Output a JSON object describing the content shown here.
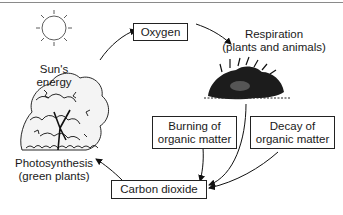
{
  "diagram": {
    "type": "carbon-oxygen cycle",
    "nodes": {
      "sun": {
        "line1": "Sun's",
        "line2": "energy",
        "icon": "sun-icon"
      },
      "oxygen": {
        "label": "Oxygen"
      },
      "respiration": {
        "line1": "Respiration",
        "line2": "(plants and animals)",
        "icon": "animal-icon"
      },
      "photosynthesis": {
        "line1": "Photosynthesis",
        "line2": "(green plants)",
        "icon": "tree-icon"
      },
      "burning": {
        "line1": "Burning of",
        "line2": "organic matter"
      },
      "decay": {
        "line1": "Decay of",
        "line2": "organic matter"
      },
      "carbon_dioxide": {
        "label": "Carbon dioxide"
      }
    },
    "edges": [
      {
        "from": "photosynthesis",
        "to": "oxygen"
      },
      {
        "from": "oxygen",
        "to": "respiration"
      },
      {
        "from": "respiration",
        "to": "carbon_dioxide"
      },
      {
        "from": "burning",
        "to": "carbon_dioxide"
      },
      {
        "from": "decay",
        "to": "carbon_dioxide"
      },
      {
        "from": "carbon_dioxide",
        "to": "photosynthesis"
      }
    ]
  }
}
